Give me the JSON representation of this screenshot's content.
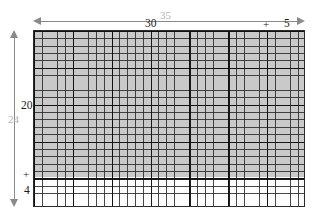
{
  "figure": {
    "type": "grid-dimension-diagram"
  },
  "grid": {
    "columns": 35,
    "rows": 24,
    "major_line_interval": 5,
    "shaded_region": {
      "columns": 35,
      "rows": 20,
      "fill": "#c9c9c9"
    },
    "unshaded_region": {
      "columns": 35,
      "rows": 4,
      "fill": "#fdfdfd"
    },
    "border_color": "#2b2b2b",
    "minor_line_color": "#282828",
    "major_line_color": "#0f0f0f"
  },
  "top_dimension": {
    "total_label": "35",
    "total_label_color": "#b2b2b2",
    "part_a": "30",
    "operator": "+",
    "part_b": "5",
    "part_color": "#1a1a1a",
    "arrow_color": "#8a8a8a"
  },
  "left_dimension": {
    "total_label": "24",
    "total_label_color": "#b2b2b2",
    "part_a": "20",
    "operator": "+",
    "part_b": "4",
    "part_color": "#1a1a1a",
    "arrow_color": "#8a8a8a"
  },
  "chart_data": {
    "type": "table",
    "title": "",
    "xlabel": "",
    "ylabel": "",
    "categories": [
      "width",
      "height"
    ],
    "series": [
      {
        "name": "total",
        "values": [
          35,
          24
        ]
      },
      {
        "name": "part_a",
        "values": [
          30,
          20
        ]
      },
      {
        "name": "part_b",
        "values": [
          5,
          4
        ]
      }
    ],
    "annotations": [
      "35",
      "30",
      "+",
      "5",
      "24",
      "20",
      "+",
      "4"
    ]
  }
}
